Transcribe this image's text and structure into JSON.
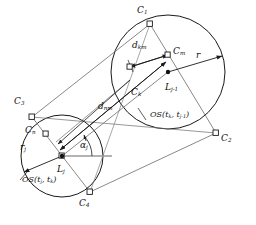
{
  "figure": {
    "background": "#ffffff",
    "stroke": "#1a1a1a",
    "thin_stroke": "#555555",
    "width": 256,
    "height": 225
  },
  "circles": {
    "left": {
      "name": "OS(tj, tk)",
      "cx": 62,
      "cy": 156,
      "r": 41,
      "center_label": "L",
      "center_sub": "j",
      "radius_label": "r",
      "radius_sub": "j"
    },
    "right": {
      "name": "OS(tk, tj-1)",
      "cx": 168,
      "cy": 72,
      "r": 57,
      "center_label": "L",
      "center_sub": "j-1",
      "radius_label": "r",
      "radius_sub": ""
    }
  },
  "labels": {
    "c1": {
      "text": "C",
      "sub": "1",
      "x": 139,
      "y": 11
    },
    "c2": {
      "text": "C",
      "sub": "2",
      "x": 227,
      "y": 139
    },
    "c3": {
      "text": "C",
      "sub": "3",
      "x": 14,
      "y": 101
    },
    "c4": {
      "text": "C",
      "sub": "4",
      "x": 77,
      "y": 205
    },
    "cm_right": {
      "text": "C",
      "sub": "m",
      "x": 172,
      "y": 50
    },
    "ck": {
      "text": "C",
      "sub": "k",
      "x": 134,
      "y": 91
    },
    "cn_left": {
      "text": "C",
      "sub": "n",
      "x": 26,
      "y": 131
    },
    "dkm": {
      "text": "d",
      "sub": "km",
      "x": 133,
      "y": 44
    },
    "dnm": {
      "text": "d",
      "sub": "nm",
      "x": 99,
      "y": 104
    },
    "r_right": {
      "text": "r",
      "sub": "",
      "x": 196,
      "y": 56
    },
    "rj_left": {
      "text": "r",
      "sub": "j",
      "x": 20,
      "y": 147
    },
    "lj_1": {
      "text": "L",
      "sub": "j-1",
      "x": 166,
      "y": 87
    },
    "lj": {
      "text": "L",
      "sub": "j",
      "x": 58,
      "y": 169
    },
    "alpha_j": {
      "text": "α",
      "sub": "j",
      "x": 80,
      "y": 146
    },
    "os_right": {
      "text": "OS(t",
      "sub": "k",
      "text2": ", t",
      "sub2": "j-1",
      "text3": ")",
      "x": 150,
      "y": 116
    },
    "os_left": {
      "text": "OS(t",
      "sub": "j",
      "text2": ", t",
      "sub2": "k",
      "text3": ")",
      "x": 22,
      "y": 181
    }
  },
  "markers": {
    "corner_squares": "small open squares at tangent / corner points",
    "filled_dots": "filled circular dots at circle centers Lj and Lj-1"
  }
}
